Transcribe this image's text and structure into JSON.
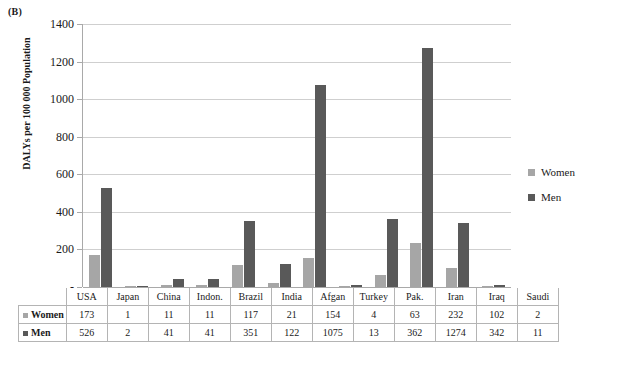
{
  "figure": {
    "panel_label": "(B)"
  },
  "chart_data": {
    "type": "bar",
    "title": "",
    "panel": "(B)",
    "xlabel": "",
    "ylabel": "DALYs per 100 000 Population",
    "categories": [
      "USA",
      "Japan",
      "China",
      "Indon.",
      "Brazil",
      "India",
      "Afgan",
      "Turkey",
      "Pak.",
      "Iran",
      "Iraq",
      "Saudi"
    ],
    "series": [
      {
        "name": "Women",
        "color": "#a6a6a6",
        "values": [
          173,
          1,
          11,
          11,
          117,
          21,
          154,
          4,
          63,
          232,
          102,
          2
        ]
      },
      {
        "name": "Men",
        "color": "#595959",
        "values": [
          526,
          2,
          41,
          41,
          351,
          122,
          1075,
          13,
          362,
          1274,
          342,
          11
        ]
      }
    ],
    "ylim": [
      0,
      1400
    ],
    "yticks": [
      0,
      200,
      400,
      600,
      800,
      1000,
      1200,
      1400
    ],
    "ytick_labels": [
      "-",
      "200",
      "400",
      "600",
      "800",
      "1000",
      "1200",
      "1400"
    ],
    "grid": true,
    "legend_position": "right",
    "data_table_shown": true
  },
  "legend": {
    "items": [
      {
        "label": "Women",
        "color": "#a6a6a6"
      },
      {
        "label": "Men",
        "color": "#595959"
      }
    ]
  },
  "table": {
    "columns": [
      "USA",
      "Japan",
      "China",
      "Indon.",
      "Brazil",
      "India",
      "Afgan",
      "Turkey",
      "Pak.",
      "Iran",
      "Iraq",
      "Saudi"
    ],
    "rows": [
      {
        "label": "Women",
        "color": "#a6a6a6",
        "values": [
          "173",
          "1",
          "11",
          "11",
          "117",
          "21",
          "154",
          "4",
          "63",
          "232",
          "102",
          "2"
        ]
      },
      {
        "label": "Men",
        "color": "#595959",
        "values": [
          "526",
          "2",
          "41",
          "41",
          "351",
          "122",
          "1075",
          "13",
          "362",
          "1274",
          "342",
          "11"
        ]
      }
    ]
  }
}
